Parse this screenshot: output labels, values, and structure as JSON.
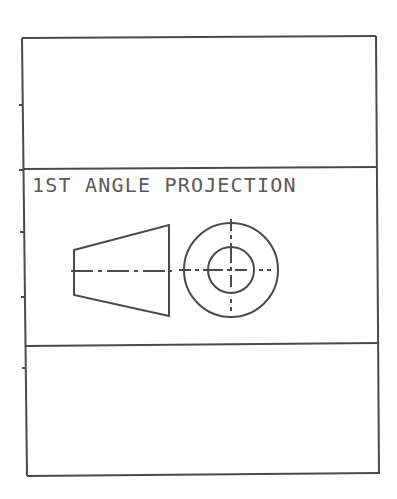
{
  "drawing": {
    "title": "1ST ANGLE PROJECTION",
    "colors": {
      "line": "#4a4a4a",
      "text": "#5a5a5a",
      "background": "#ffffff"
    },
    "frame": {
      "sections": [
        "top-panel",
        "projection-symbol-panel",
        "bottom-panel"
      ],
      "left_edge_ticks": 5
    },
    "symbol": {
      "front_view": "truncated-cone-side-view",
      "side_view": "concentric-circles-with-centerlines"
    }
  }
}
